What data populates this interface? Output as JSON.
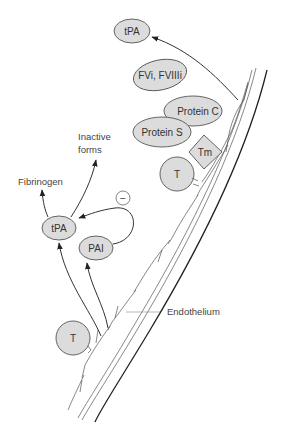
{
  "diagram": {
    "nodes": {
      "tpa_top": "tPA",
      "fvi_fviii": "FVi, FVIIIi",
      "protein_c": "Protein C",
      "protein_s": "Protein S",
      "tm": "Tm",
      "t_upper": "T",
      "tpa_left": "tPA",
      "pai": "PAI",
      "t_lower": "T",
      "inhibition": "−"
    },
    "labels": {
      "inactive_line1": "Inactive",
      "inactive_line2": "forms",
      "fibrinogen": "Fibrinogen",
      "endothelium": "Endothelium"
    },
    "colors": {
      "node_fill": "#dcdcdc",
      "stroke": "#333333",
      "background": "#ffffff"
    }
  }
}
